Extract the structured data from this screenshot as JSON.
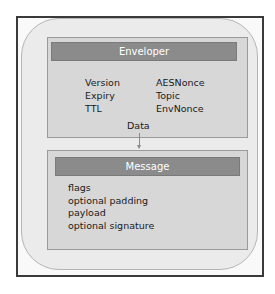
{
  "diagram": {
    "enveloper": {
      "title": "Enveloper",
      "fields_left": [
        "Version",
        "Expiry",
        "TTL"
      ],
      "fields_right": [
        "AESNonce",
        "Topic",
        "EnvNonce"
      ],
      "data_label": "Data"
    },
    "message": {
      "title": "Message",
      "fields": [
        "flags",
        "optional padding",
        "payload",
        "optional signature"
      ]
    },
    "colors": {
      "header_fill": "#8b8b8b",
      "box_fill": "#d7d7d7",
      "container_fill": "#ebebeb",
      "frame_border": "#3a3a3a"
    }
  }
}
